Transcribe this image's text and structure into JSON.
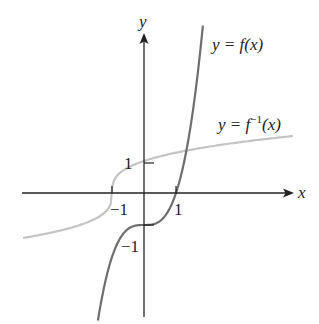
{
  "chart_data": {
    "type": "line",
    "title": "",
    "xlabel": "x",
    "ylabel": "y",
    "xlim": [
      -3.8,
      4.7
    ],
    "ylim": [
      -3.9,
      5.0
    ],
    "grid": false,
    "legend_position": "inline labels near curves",
    "x_ticks": [
      -1,
      1
    ],
    "y_ticks": [
      1,
      -1
    ],
    "tick_labels": {
      "x": [
        "−1",
        "1"
      ],
      "y": [
        "1",
        "−1"
      ]
    },
    "series": [
      {
        "name": "y = f(x)",
        "color": "#6e6e6e",
        "formula_estimate": "x^3 - 1",
        "x": [
          -1.44,
          -1.2,
          -1.0,
          -0.8,
          -0.5,
          0,
          0.5,
          0.8,
          1.0,
          1.2,
          1.5,
          1.84
        ],
        "y": [
          -3.99,
          -2.73,
          -2.0,
          -1.51,
          -1.13,
          -1.0,
          -0.88,
          -0.49,
          0.0,
          0.73,
          2.38,
          5.23
        ]
      },
      {
        "name": "y = f^-1(x)",
        "color": "#c4c4c4",
        "formula_estimate": "cbrt(x + 1)",
        "x": [
          -3.78,
          -3.0,
          -2.0,
          -1.5,
          -1.0,
          -0.5,
          0,
          1.0,
          2.0,
          3.0,
          4.65
        ],
        "y": [
          -1.41,
          -1.26,
          -1.0,
          -0.79,
          0.0,
          0.79,
          1.0,
          1.26,
          1.44,
          1.59,
          1.78
        ]
      }
    ]
  },
  "labels": {
    "x_axis": "x",
    "y_axis": "y",
    "f_label_prefix": "y = ",
    "f_label_fn": "f",
    "f_label_arg": "(x)",
    "finv_label_prefix": "y = ",
    "finv_label_fn": "f",
    "finv_label_sup": "−1",
    "finv_label_arg": "(x)",
    "tick_x_neg1": "−1",
    "tick_x_1": "1",
    "tick_y_1": "1",
    "tick_y_neg1": "−1"
  }
}
